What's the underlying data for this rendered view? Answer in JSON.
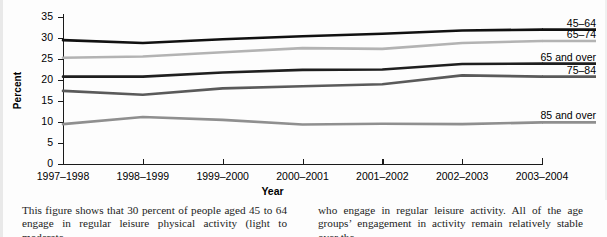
{
  "chart_data": {
    "type": "line",
    "title": "",
    "xlabel": "Year",
    "ylabel": "Percent",
    "ylim": [
      0,
      35
    ],
    "yticks": [
      0,
      5,
      10,
      15,
      20,
      25,
      30,
      35
    ],
    "grid": false,
    "legend_position": "right-of-line-ends",
    "categories": [
      "1997–1998",
      "1998–1999",
      "1999–2000",
      "2000–2001",
      "2001–2002",
      "2002–2003",
      "2003–2004"
    ],
    "series": [
      {
        "name": "45–64",
        "color": "#111111",
        "width": 2.6,
        "values": [
          29.5,
          28.8,
          29.7,
          30.4,
          31.0,
          31.8,
          32.0
        ]
      },
      {
        "name": "65–74",
        "color": "#b3b3b3",
        "width": 2.6,
        "values": [
          25.3,
          25.6,
          26.6,
          27.6,
          27.4,
          28.8,
          29.3
        ]
      },
      {
        "name": "65 and over",
        "color": "#1f1f1f",
        "width": 2.6,
        "values": [
          20.8,
          20.8,
          21.8,
          22.4,
          22.5,
          23.8,
          23.9
        ]
      },
      {
        "name": "75–84",
        "color": "#5a5a5a",
        "width": 2.6,
        "values": [
          17.4,
          16.5,
          18.0,
          18.5,
          19.0,
          21.1,
          20.8
        ]
      },
      {
        "name": "85 and over",
        "color": "#8f8f8f",
        "width": 2.6,
        "values": [
          9.5,
          11.2,
          10.5,
          9.4,
          9.6,
          9.5,
          9.9
        ]
      }
    ]
  },
  "axes": {
    "y_title": "Percent",
    "x_title": "Year",
    "y_ticks": [
      "35",
      "30",
      "25",
      "20",
      "15",
      "10",
      "5",
      "0"
    ],
    "x_ticks": [
      "1997–1998",
      "1998–1999",
      "1999–2000",
      "2000–2001",
      "2001–2002",
      "2002–2003",
      "2003–2004"
    ]
  },
  "series_labels": [
    {
      "text": "45–64"
    },
    {
      "text": "65–74"
    },
    {
      "text": "65 and over"
    },
    {
      "text": "75–84"
    },
    {
      "text": "85 and over"
    }
  ],
  "caption": {
    "left": "This figure shows that 30 percent of people aged 45 to 64 engage in regular leisure physical activity (light to moderate",
    "right": "who engage in regular leisure activity. All of the age groups’ engagement in activity remain relatively stable over the"
  }
}
